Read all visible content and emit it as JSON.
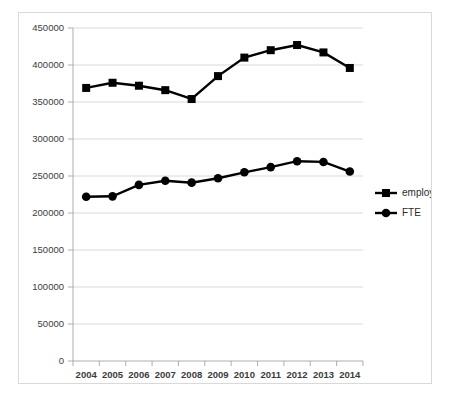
{
  "chart_data": {
    "type": "line",
    "title": "",
    "subtitle": "",
    "xlabel": "",
    "ylabel": "",
    "categories": [
      "2004",
      "2005",
      "2006",
      "2007",
      "2008",
      "2009",
      "2010",
      "2011",
      "2012",
      "2013",
      "2014"
    ],
    "series": [
      {
        "name": "employees",
        "marker": "square",
        "color": "#000000",
        "values": [
          369000,
          376000,
          372000,
          366000,
          354000,
          385000,
          410000,
          420000,
          427000,
          417000,
          396000
        ]
      },
      {
        "name": "FTE",
        "marker": "circle",
        "color": "#000000",
        "values": [
          222000,
          222500,
          238000,
          243500,
          241000,
          247000,
          255000,
          262000,
          270000,
          269000,
          256000
        ]
      }
    ],
    "ylim": [
      0,
      450000
    ],
    "ytick_values": [
      0,
      50000,
      100000,
      150000,
      200000,
      250000,
      300000,
      350000,
      400000,
      450000
    ],
    "ytick_labels": [
      "0",
      "50000",
      "100000",
      "150000",
      "200000",
      "250000",
      "300000",
      "350000",
      "400000",
      "450000"
    ],
    "xtick_labels": [
      "2004",
      "2005",
      "2006",
      "2007",
      "2008",
      "2009",
      "2010",
      "2011",
      "2012",
      "2013",
      "2014"
    ],
    "grid": "horizontal",
    "legend_position": "right",
    "legend_entries": [
      "employees",
      "FTE"
    ]
  },
  "legend": {
    "entries": [
      {
        "label": "employees",
        "marker": "square"
      },
      {
        "label": "FTE",
        "marker": "circle"
      }
    ]
  },
  "axis": {
    "y_labels": [
      "450000",
      "400000",
      "350000",
      "300000",
      "250000",
      "200000",
      "150000",
      "100000",
      "50000",
      "0"
    ],
    "x_labels": [
      "2004",
      "2005",
      "2006",
      "2007",
      "2008",
      "2009",
      "2010",
      "2011",
      "2012",
      "2013",
      "2014"
    ]
  }
}
